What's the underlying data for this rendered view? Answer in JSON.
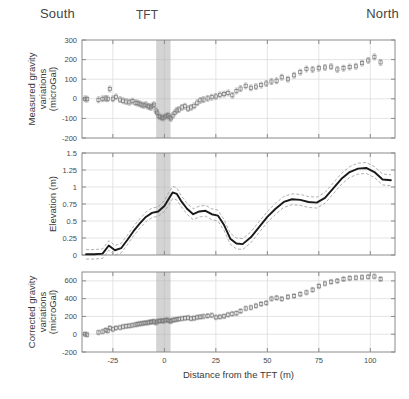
{
  "figure": {
    "orientation_labels": {
      "left": "South",
      "right": "North"
    },
    "marker_label": "TFT",
    "xlabel": "Distance from the TFT (m)",
    "band": {
      "x_start": -4.0,
      "x_end": 3.0,
      "color": "#b0b0b0"
    }
  },
  "chart_data": [
    {
      "type": "scatter",
      "title": "",
      "panel": "top",
      "ylabel": "Measured gravity variations (microGal)",
      "xlabel": "",
      "xlim": [
        -40,
        112
      ],
      "ylim": [
        -200,
        300
      ],
      "yticks": [
        -200,
        -100,
        0,
        100,
        200,
        300
      ],
      "xticks": [
        -25,
        0,
        25,
        50,
        75,
        100
      ],
      "grid": true,
      "errorbars": true,
      "x": [
        -38.5,
        -37.5,
        -32.0,
        -30.0,
        -28.5,
        -27.5,
        -26.5,
        -25.0,
        -23.5,
        -21.5,
        -20.0,
        -18.5,
        -17.0,
        -15.5,
        -14.0,
        -13.0,
        -12.0,
        -11.0,
        -10.0,
        -9.0,
        -8.0,
        -7.2,
        -6.5,
        -5.8,
        -5.0,
        -4.2,
        -3.5,
        -2.8,
        -2.0,
        -1.2,
        -0.5,
        0.2,
        1.0,
        1.8,
        2.5,
        3.2,
        4.0,
        5.0,
        6.0,
        7.0,
        8.5,
        10.0,
        11.5,
        13.0,
        14.5,
        16.0,
        17.5,
        19.0,
        21.0,
        23.0,
        25.0,
        27.0,
        29.0,
        31.0,
        33.0,
        35.0,
        37.0,
        39.5,
        42.0,
        44.5,
        47.0,
        49.5,
        52.0,
        54.5,
        57.0,
        60.0,
        63.0,
        66.0,
        69.0,
        72.0,
        75.0,
        78.0,
        81.0,
        84.0,
        87.0,
        90.0,
        93.0,
        96.0,
        99.0,
        102.0,
        105.0
      ],
      "y": [
        0,
        -2,
        -5,
        0,
        2,
        0,
        50,
        0,
        10,
        -4,
        -10,
        -14,
        -18,
        -12,
        -20,
        -22,
        -26,
        -30,
        -34,
        -30,
        -38,
        -40,
        -44,
        -36,
        -30,
        -60,
        -70,
        -88,
        -92,
        -96,
        -98,
        -92,
        -88,
        -84,
        -94,
        -100,
        -86,
        -72,
        -60,
        -55,
        -44,
        -38,
        -50,
        -44,
        -36,
        -20,
        -8,
        -4,
        2,
        8,
        12,
        20,
        24,
        30,
        18,
        40,
        52,
        66,
        56,
        62,
        70,
        78,
        88,
        92,
        110,
        100,
        120,
        136,
        152,
        150,
        156,
        160,
        164,
        150,
        156,
        162,
        166,
        182,
        196,
        214,
        186
      ]
    },
    {
      "type": "line",
      "panel": "middle",
      "ylabel": "Elevation (m)",
      "xlabel": "",
      "xlim": [
        -40,
        112
      ],
      "ylim": [
        0,
        1.5
      ],
      "yticks": [
        0,
        0.25,
        0.5,
        0.75,
        1,
        1.25,
        1.5
      ],
      "xticks": [
        -25,
        0,
        25,
        50,
        75,
        100
      ],
      "grid": true,
      "series": [
        {
          "name": "Elevation",
          "x": [
            -38,
            -34,
            -30,
            -27,
            -24,
            -21,
            -18,
            -15,
            -12,
            -9,
            -6,
            -3,
            0,
            2,
            4,
            6,
            8,
            11,
            14,
            17,
            20,
            23,
            26,
            29,
            32,
            35,
            38,
            42,
            46,
            50,
            54,
            58,
            62,
            66,
            70,
            74,
            78,
            82,
            86,
            90,
            94,
            98,
            102,
            106,
            110
          ],
          "values": [
            0.01,
            0.01,
            0.02,
            0.14,
            0.07,
            0.1,
            0.22,
            0.35,
            0.46,
            0.56,
            0.62,
            0.64,
            0.72,
            0.82,
            0.92,
            0.9,
            0.8,
            0.68,
            0.6,
            0.64,
            0.65,
            0.6,
            0.58,
            0.44,
            0.24,
            0.17,
            0.16,
            0.26,
            0.41,
            0.56,
            0.68,
            0.78,
            0.82,
            0.81,
            0.78,
            0.77,
            0.84,
            0.98,
            1.12,
            1.22,
            1.27,
            1.28,
            1.22,
            1.11,
            1.1
          ]
        },
        {
          "name": "upper confidence bound",
          "x": [
            -38,
            -34,
            -30,
            -27,
            -24,
            -21,
            -18,
            -15,
            -12,
            -9,
            -6,
            -3,
            0,
            2,
            4,
            6,
            8,
            11,
            14,
            17,
            20,
            23,
            26,
            29,
            32,
            35,
            38,
            42,
            46,
            50,
            54,
            58,
            62,
            66,
            70,
            74,
            78,
            82,
            86,
            90,
            94,
            98,
            102,
            106,
            110
          ],
          "values": [
            0.08,
            0.08,
            0.09,
            0.21,
            0.14,
            0.17,
            0.29,
            0.42,
            0.53,
            0.63,
            0.69,
            0.71,
            0.8,
            0.91,
            1.01,
            0.99,
            0.88,
            0.76,
            0.68,
            0.72,
            0.73,
            0.68,
            0.66,
            0.52,
            0.32,
            0.25,
            0.24,
            0.34,
            0.49,
            0.64,
            0.76,
            0.86,
            0.9,
            0.89,
            0.86,
            0.85,
            0.92,
            1.06,
            1.2,
            1.3,
            1.35,
            1.36,
            1.3,
            1.19,
            1.18
          ]
        },
        {
          "name": "lower confidence bound",
          "x": [
            -38,
            -34,
            -30,
            -27,
            -24,
            -21,
            -18,
            -15,
            -12,
            -9,
            -6,
            -3,
            0,
            2,
            4,
            6,
            8,
            11,
            14,
            17,
            20,
            23,
            26,
            29,
            32,
            35,
            38,
            42,
            46,
            50,
            54,
            58,
            62,
            66,
            70,
            74,
            78,
            82,
            86,
            90,
            94,
            98,
            102,
            106,
            110
          ],
          "values": [
            -0.06,
            -0.06,
            -0.05,
            0.07,
            0.0,
            0.03,
            0.15,
            0.28,
            0.39,
            0.49,
            0.55,
            0.57,
            0.64,
            0.73,
            0.83,
            0.81,
            0.72,
            0.6,
            0.52,
            0.56,
            0.57,
            0.52,
            0.5,
            0.36,
            0.16,
            0.09,
            0.08,
            0.18,
            0.33,
            0.48,
            0.6,
            0.7,
            0.74,
            0.73,
            0.7,
            0.69,
            0.76,
            0.9,
            1.04,
            1.14,
            1.19,
            1.2,
            1.14,
            1.03,
            1.02
          ]
        }
      ]
    },
    {
      "type": "scatter",
      "panel": "bottom",
      "ylabel": "Corrected gravity variations (microGal)",
      "xlabel": "Distance from the TFT (m)",
      "xlim": [
        -40,
        112
      ],
      "ylim": [
        -200,
        700
      ],
      "yticks": [
        -200,
        0,
        200,
        400,
        600
      ],
      "xticks": [
        -25,
        0,
        25,
        50,
        75,
        100
      ],
      "grid": true,
      "errorbars": true,
      "x": [
        -38.5,
        -37.5,
        -32.0,
        -30.0,
        -28.5,
        -27.5,
        -26.5,
        -25.0,
        -23.5,
        -21.5,
        -20.0,
        -18.5,
        -17.0,
        -15.5,
        -14.0,
        -13.0,
        -12.0,
        -11.0,
        -10.0,
        -9.0,
        -8.0,
        -7.2,
        -6.5,
        -5.8,
        -5.0,
        -4.2,
        -3.5,
        -2.8,
        -2.0,
        -1.2,
        -0.5,
        0.2,
        1.0,
        1.8,
        2.5,
        3.2,
        4.0,
        5.0,
        6.0,
        7.0,
        8.5,
        10.0,
        11.5,
        13.0,
        14.5,
        16.0,
        17.5,
        19.0,
        21.0,
        23.0,
        25.0,
        27.0,
        29.0,
        31.0,
        33.0,
        35.0,
        37.0,
        39.5,
        42.0,
        44.5,
        47.0,
        49.5,
        52.0,
        54.5,
        57.0,
        60.0,
        63.0,
        66.0,
        69.0,
        72.0,
        75.0,
        78.0,
        81.0,
        84.0,
        87.0,
        90.0,
        93.0,
        96.0,
        99.0,
        102.0,
        105.0
      ],
      "y": [
        0,
        -5,
        20,
        30,
        45,
        40,
        70,
        55,
        70,
        75,
        85,
        90,
        95,
        100,
        108,
        112,
        118,
        120,
        124,
        128,
        130,
        134,
        138,
        140,
        144,
        130,
        140,
        148,
        150,
        152,
        148,
        155,
        160,
        158,
        150,
        146,
        158,
        162,
        166,
        170,
        176,
        180,
        186,
        176,
        180,
        190,
        196,
        200,
        206,
        212,
        190,
        196,
        202,
        220,
        230,
        236,
        260,
        290,
        300,
        320,
        340,
        352,
        400,
        410,
        398,
        420,
        430,
        450,
        470,
        500,
        540,
        570,
        590,
        600,
        620,
        630,
        636,
        640,
        646,
        650,
        620
      ]
    }
  ]
}
